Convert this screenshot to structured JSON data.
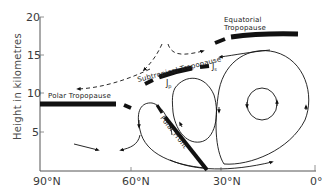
{
  "diagram": {
    "type": "meridional-cross-section",
    "y_axis": {
      "title": "Height in kilometres",
      "ticks": [
        "20",
        "15",
        "10",
        "5"
      ]
    },
    "x_axis": {
      "ticks": [
        "90°N",
        "60°N",
        "30°N",
        "0°"
      ]
    },
    "labels": {
      "equatorial_tropopause_line1": "Equatorial",
      "equatorial_tropopause_line2": "Tropopause",
      "subtropical_tropopause": "Subtropical Tropopause",
      "polar_tropopause": "Polar Tropopause",
      "polar_front": "Polar Front",
      "jet_subtropical": "J",
      "jet_subtropical_sub": "s",
      "jet_polar": "J",
      "jet_polar_sub": "p"
    },
    "colors": {
      "ink": "#111111",
      "axis": "#555555",
      "background": "#ffffff"
    }
  }
}
